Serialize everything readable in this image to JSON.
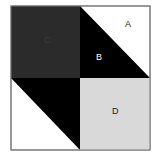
{
  "diagram": {
    "labels": {
      "A": "A",
      "B": "B",
      "C": "C",
      "D": "D"
    },
    "colors": {
      "dark_gray": "#2b2b2b",
      "black": "#000000",
      "light_gray": "#d9d9d9",
      "white": "#ffffff",
      "border": "#777777"
    }
  }
}
